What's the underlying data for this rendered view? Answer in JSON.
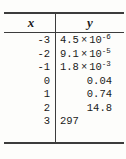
{
  "figure": {
    "kind": "data-table",
    "columns": [
      "x",
      "y"
    ],
    "header": {
      "x_label": "x",
      "y_label": "y"
    },
    "rows": [
      {
        "x": "-3",
        "y_display": "4.5 × 10⁻⁶",
        "y_mantissa": "4.5",
        "y_times": "×",
        "y_base": "10",
        "y_exponent": "-6",
        "scientific": true
      },
      {
        "x": "-2",
        "y_display": "9.1 × 10⁻⁵",
        "y_mantissa": "9.1",
        "y_times": "×",
        "y_base": "10",
        "y_exponent": "-5",
        "scientific": true
      },
      {
        "x": "-1",
        "y_display": "1.8 × 10⁻³",
        "y_mantissa": "1.8",
        "y_times": "×",
        "y_base": "10",
        "y_exponent": "-3",
        "scientific": true
      },
      {
        "x": "0",
        "y_display": "0.04",
        "y_mantissa": "0.04",
        "y_times": "",
        "y_base": "",
        "y_exponent": "",
        "scientific": false
      },
      {
        "x": "1",
        "y_display": "0.74",
        "y_mantissa": "0.74",
        "y_times": "",
        "y_base": "",
        "y_exponent": "",
        "scientific": false
      },
      {
        "x": "2",
        "y_display": "14.8",
        "y_mantissa": "14.8",
        "y_times": "",
        "y_base": "",
        "y_exponent": "",
        "scientific": false
      },
      {
        "x": "3",
        "y_display": "297",
        "y_mantissa": "297",
        "y_times": "",
        "y_base": "",
        "y_exponent": "",
        "scientific": false
      }
    ]
  },
  "chart_data": {
    "type": "table",
    "title": "",
    "xlabel": "x",
    "ylabel": "y",
    "columns": [
      "x",
      "y"
    ],
    "x": [
      -3,
      -2,
      -1,
      0,
      1,
      2,
      3
    ],
    "values": [
      4.5e-06,
      9.1e-05,
      0.0018,
      0.04,
      0.74,
      14.8,
      297
    ],
    "value_labels": [
      "4.5 × 10⁻⁶",
      "9.1 × 10⁻⁵",
      "1.8 × 10⁻³",
      "0.04",
      "0.74",
      "14.8",
      "297"
    ],
    "grid": false,
    "legend": "none"
  },
  "style": {
    "rule_color": "#3c3c3c",
    "text_color": "#1a1a1a",
    "background": "#fdfdfb"
  }
}
